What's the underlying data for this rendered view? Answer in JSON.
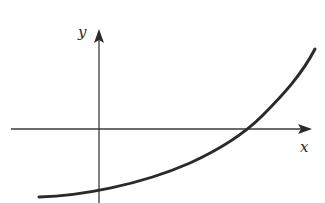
{
  "figure": {
    "type": "function-graph",
    "axes": {
      "x_label": "x",
      "y_label": "y"
    },
    "colors": {
      "background": "#ffffff",
      "axis": "#3a3a3a",
      "curve": "#2a2a2a"
    },
    "curve": {
      "shape": "concave-up increasing",
      "y_intercept_sign": "negative",
      "x_intercept_sign": "positive"
    }
  }
}
